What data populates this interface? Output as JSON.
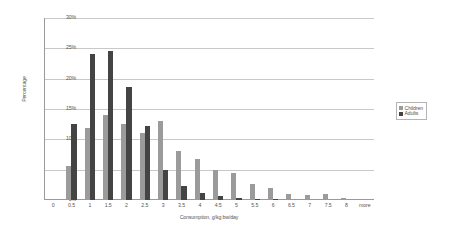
{
  "chart_data": {
    "type": "bar",
    "title": "",
    "xlabel": "Consumption, g/kg bw/day",
    "ylabel": "Percentage",
    "ylim": [
      0,
      30
    ],
    "yticks": [
      "0%",
      "5%",
      "10%",
      "15%",
      "20%",
      "25%",
      "30%"
    ],
    "ytick_values": [
      0,
      5,
      10,
      15,
      20,
      25,
      30
    ],
    "grid": true,
    "legend_position": "right",
    "categories": [
      "0",
      "0.5",
      "1",
      "1.5",
      "2",
      "2.5",
      "3",
      "3.5",
      "4",
      "4.5",
      "5",
      "5.5",
      "6",
      "6.5",
      "7",
      "7.5",
      "8",
      "more"
    ],
    "series": [
      {
        "name": "Children",
        "color": "#9b9b9b",
        "values": [
          0,
          5.6,
          11.8,
          14.0,
          12.6,
          11.1,
          13.0,
          8.0,
          6.7,
          5.0,
          4.5,
          2.6,
          2.0,
          1.0,
          0.9,
          1.0,
          0.3,
          0.0
        ]
      },
      {
        "name": "Adults",
        "color": "#444444",
        "values": [
          0,
          12.5,
          24.0,
          24.6,
          18.6,
          12.2,
          5.0,
          2.3,
          1.2,
          0.6,
          0.3,
          0.2,
          0.1,
          0.0,
          0.0,
          0.0,
          0.0,
          0.0
        ]
      }
    ]
  },
  "legend": {
    "items": [
      {
        "label": "Children"
      },
      {
        "label": "Adults"
      }
    ]
  }
}
